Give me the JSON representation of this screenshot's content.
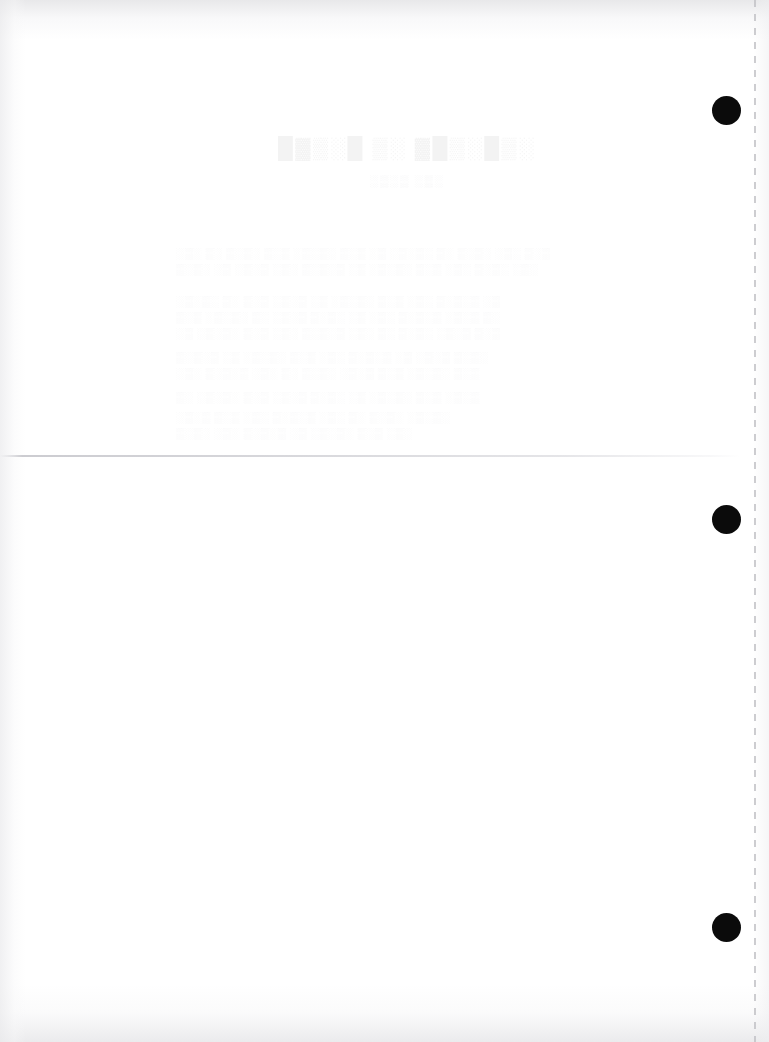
{
  "document": {
    "page_width": 769,
    "page_height": 1042,
    "background_color": "#ffffff",
    "appearance": "blank scanned page with faint reverse-side bleed-through"
  },
  "marks": {
    "punch_dots": {
      "color": "#0b0b0b",
      "diameter": 29,
      "items": [
        {
          "label": "top-registration-dot",
          "x": 712,
          "y": 96
        },
        {
          "label": "middle-registration-dot",
          "x": 712,
          "y": 505
        },
        {
          "label": "bottom-registration-dot",
          "x": 712,
          "y": 913
        }
      ]
    },
    "perforation": {
      "label": "right-margin perforation strip",
      "color": "#c4c4c8",
      "x": 754
    },
    "fold": {
      "label": "horizontal fold crease",
      "color": "#c9c9ce",
      "y": 455
    }
  },
  "ghost_text": {
    "note": "illegible bleed-through from the reverse side of the sheet",
    "color": "#969698",
    "title": {
      "text": "█▓▒░█ ▒░ ▓█▒░█▒░",
      "x": 278,
      "y": 136
    },
    "subtitle": {
      "text": "░▒░▒ ░▒░",
      "x": 370,
      "y": 174
    },
    "body_lines": [
      {
        "text": "░▒░ ▒░ ▒░▒░ ▒░▒ ░▒░▒░ ▒░▒ ░▒ ░▒░▒░ ▒░ ▒░▒░ ░▒░ ▒░▒",
        "x": 176,
        "y": 248
      },
      {
        "text": "▒░▒░ ░▒ ░▒░▒ ░▒░ ▒░▒░▒ ░▒ ░▒░▒░ ▒░▒ ░▒░ ▒░▒░ ░▒░",
        "x": 176,
        "y": 264
      },
      {
        "text": "░▒░▒░ ▒░ ▒░▒ ░▒░▒ ░▒ ░▒░▒░ ▒░▒ ░▒░ ▒░▒░▒ ░▒",
        "x": 176,
        "y": 296
      },
      {
        "text": "▒░▒ ░▒░▒░ ▒░ ░▒░▒ ▒░▒░ ░▒ ░▒░ ▒░▒░▒ ░▒░▒ ▒░",
        "x": 176,
        "y": 312
      },
      {
        "text": "░▒ ░▒░▒░ ▒░▒ ░▒░ ▒░▒░▒ ░▒░ ▒░ ▒░▒░ ░▒░▒ ▒░▒",
        "x": 176,
        "y": 328
      },
      {
        "text": "▒░▒░▒ ░▒ ░▒░▒░ ▒░▒ ░▒░ ▒░▒░▒ ░▒ ░▒░▒ ▒░▒░",
        "x": 176,
        "y": 352
      },
      {
        "text": "░▒░ ▒░▒░▒ ░▒░ ▒░ ▒░▒░ ░▒░▒ ▒░▒ ░▒░▒░ ▒░▒",
        "x": 176,
        "y": 368
      },
      {
        "text": "▒░ ░▒░▒░ ▒░▒ ░▒░▒ ▒░▒░ ░▒ ░▒░▒░ ▒░▒ ░▒░▒",
        "x": 176,
        "y": 392
      },
      {
        "text": "░▒░▒ ▒░▒ ░▒░ ▒░▒░▒ ░▒░ ▒░ ▒░▒░ ░▒░▒░",
        "x": 176,
        "y": 412
      },
      {
        "text": "▒░▒░ ░▒░ ▒░▒░▒ ░▒ ░▒░▒░ ▒░▒ ░▒░",
        "x": 176,
        "y": 428
      }
    ]
  }
}
